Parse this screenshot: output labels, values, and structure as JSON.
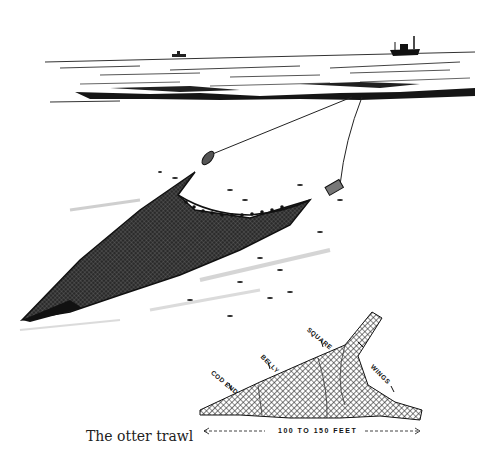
{
  "caption": "The otter trawl",
  "diagram": {
    "labels": {
      "cod_end": "COD END",
      "belly": "BELLY",
      "square": "SQUARE",
      "wings": "WINGS"
    },
    "dimension": "100 TO 150 FEET"
  },
  "colors": {
    "ink": "#111111",
    "paper": "#ffffff",
    "net_fill": "#3a3a3a"
  }
}
